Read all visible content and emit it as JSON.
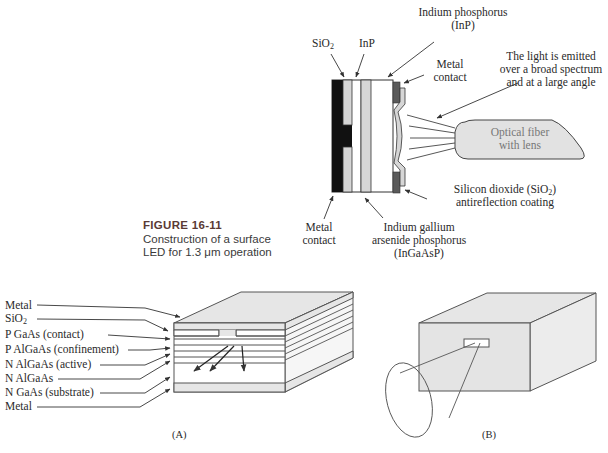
{
  "figure": {
    "number": "FIGURE 16-11",
    "caption_line1": "Construction of a surface",
    "caption_line2": "LED for 1.3 μm operation"
  },
  "top_diagram": {
    "labels": {
      "sio2": "SiO",
      "sio2_sub": "2",
      "inp": "InP",
      "indium_phosphorus_1": "Indium phosphorus",
      "indium_phosphorus_2": "(InP)",
      "metal_contact_top_1": "Metal",
      "metal_contact_top_2": "contact",
      "light_1": "The light is emitted",
      "light_2": "over a broad spectrum",
      "light_3": "and at a large angle",
      "fiber_1": "Optical fiber",
      "fiber_2": "with lens",
      "silicon_dioxide_1a": "Silicon dioxide (SiO",
      "silicon_dioxide_1sub": "2",
      "silicon_dioxide_1b": ")",
      "silicon_dioxide_2": "antireflection coating",
      "metal_contact_bottom_1": "Metal",
      "metal_contact_bottom_2": "contact",
      "ingaasp_1": "Indium gallium",
      "ingaasp_2": "arsenide phosphorus",
      "ingaasp_3": "(InGaAsP)"
    }
  },
  "panel_a": {
    "label": "(A)",
    "layers": [
      {
        "text": "Metal"
      },
      {
        "text": "SiO",
        "sub": "2"
      },
      {
        "text": "P GaAs (contact)"
      },
      {
        "text": "P AlGaAs (confinement)"
      },
      {
        "text": "N AlGaAs (active)"
      },
      {
        "text": "N AlGaAs"
      },
      {
        "text": "N GaAs (substrate)"
      },
      {
        "text": "Metal"
      }
    ]
  },
  "panel_b": {
    "label": "(B)"
  },
  "colors": {
    "line": "#555555",
    "fill_gray": "#e4e4e4",
    "dark_metal": "#111111",
    "metal_contact": "#555555",
    "figure_number": "#5a3a34"
  }
}
